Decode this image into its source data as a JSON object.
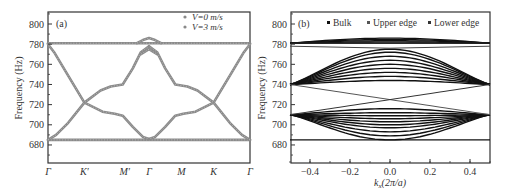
{
  "chart_data": [
    {
      "panel": "(a)",
      "type": "line",
      "ylabel": "Frequency (Hz)",
      "xlabel": "",
      "ylim": [
        665,
        812
      ],
      "yticks": [
        680,
        700,
        720,
        740,
        760,
        780,
        800
      ],
      "xtick_labels": [
        "Γ",
        "K′",
        "M′",
        "Γ",
        "M",
        "K",
        "Γ"
      ],
      "xtick_pos": [
        0,
        0.18,
        0.38,
        0.5,
        0.66,
        0.82,
        1.0
      ],
      "legend": [
        {
          "label": "V=0 m/s",
          "color": "#8a8a8a"
        },
        {
          "label": "V=3 m/s",
          "color": "#8a8a8a"
        }
      ],
      "series": [
        {
          "name": "flat-upper",
          "x": [
            0,
            1
          ],
          "y": [
            781,
            781
          ]
        },
        {
          "name": "flat-lower",
          "x": [
            0,
            1
          ],
          "y": [
            685,
            685
          ]
        },
        {
          "name": "band-down-left",
          "x": [
            0,
            0.03,
            0.09,
            0.18,
            0.27,
            0.33,
            0.37,
            0.42,
            0.47,
            0.5
          ],
          "y": [
            780,
            772,
            752,
            722,
            713,
            711,
            709,
            698,
            688,
            686
          ]
        },
        {
          "name": "band-up-left",
          "x": [
            0,
            0.04,
            0.1,
            0.18,
            0.26,
            0.31,
            0.37,
            0.42,
            0.46,
            0.5
          ],
          "y": [
            685,
            690,
            702,
            722,
            734,
            738,
            740,
            756,
            772,
            778
          ]
        },
        {
          "name": "band-down-right",
          "x": [
            1,
            0.97,
            0.91,
            0.82,
            0.73,
            0.67,
            0.63,
            0.58,
            0.53,
            0.5
          ],
          "y": [
            780,
            772,
            752,
            722,
            713,
            711,
            709,
            698,
            688,
            686
          ]
        },
        {
          "name": "band-up-right",
          "x": [
            1,
            0.96,
            0.9,
            0.82,
            0.74,
            0.69,
            0.63,
            0.58,
            0.54,
            0.5
          ],
          "y": [
            685,
            690,
            702,
            722,
            734,
            738,
            740,
            756,
            772,
            778
          ]
        },
        {
          "name": "v3-upper-bump",
          "x": [
            0.44,
            0.47,
            0.5,
            0.53,
            0.56
          ],
          "y": [
            781,
            784,
            786,
            784,
            781
          ]
        },
        {
          "name": "v3-gamma-split",
          "x": [
            0.46,
            0.5,
            0.54
          ],
          "y": [
            770,
            775,
            770
          ]
        }
      ]
    },
    {
      "panel": "(b)",
      "type": "line",
      "ylabel": "Frequency (Hz)",
      "xlabel": "kx(2π/a)",
      "xlim": [
        -0.5,
        0.5
      ],
      "ylim": [
        665,
        812
      ],
      "yticks": [
        680,
        700,
        720,
        740,
        760,
        780,
        800
      ],
      "xticks": [
        -0.4,
        -0.2,
        0.0,
        0.2,
        0.4
      ],
      "legend": [
        {
          "label": "Bulk",
          "color": "#111111"
        },
        {
          "label": "Upper edge",
          "color": "#555555"
        },
        {
          "label": "Lower edge",
          "color": "#333333"
        }
      ],
      "bands": {
        "upper_bulk": {
          "edge_freq": 740,
          "center_freqs": [
            744,
            748,
            752,
            756,
            760,
            764,
            768,
            772,
            775
          ]
        },
        "lower_bulk": {
          "edge_freq": 710,
          "center_freqs": [
            685,
            689,
            693,
            697,
            700,
            703,
            706,
            709,
            712,
            716
          ]
        },
        "top_flat": [
          781,
          778
        ],
        "top_bulk_lens": {
          "edge_freq": 781,
          "center_freq": 786
        },
        "bottom_flat": 685,
        "edge_states": [
          {
            "from": [
              -0.5,
              740
            ],
            "to": [
              0.5,
              710
            ],
            "via_center": 725
          },
          {
            "from": [
              -0.5,
              710
            ],
            "to": [
              0.5,
              740
            ],
            "via_center": 725
          }
        ]
      }
    }
  ],
  "labels": {
    "panel_a": "(a)",
    "panel_b": "(b)",
    "ylabel": "Frequency (Hz)",
    "xlabel_b_k": "k",
    "xlabel_b_sub": "x",
    "xlabel_b_rest": "(2π/a)",
    "legend_a_1": "V=0 m/s",
    "legend_a_2": "V=3 m/s",
    "legend_b_1": "Bulk",
    "legend_b_2": "Upper edge",
    "legend_b_3": "Lower edge"
  }
}
